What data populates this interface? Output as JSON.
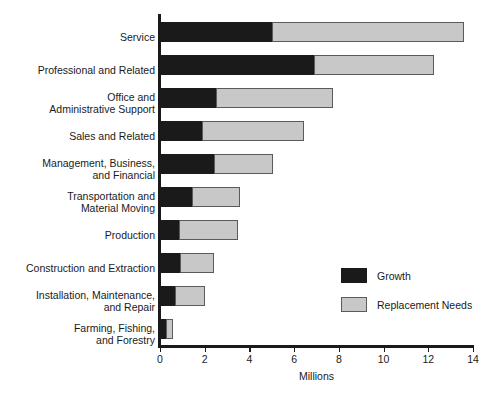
{
  "chart_data": {
    "type": "bar",
    "orientation": "horizontal",
    "stacked": true,
    "title": "",
    "xlabel": "Millions",
    "ylabel": "",
    "xlim": [
      0,
      14
    ],
    "xticks": [
      0,
      2,
      4,
      6,
      8,
      10,
      12,
      14
    ],
    "xtick_labels": [
      "0",
      "2",
      "4",
      "6",
      "8",
      "10",
      "12",
      "14"
    ],
    "grid": false,
    "legend_position": "inside-right",
    "categories": [
      "Service",
      "Professional and Related",
      "Office and\nAdministrative Support",
      "Sales and Related",
      "Management, Business,\nand Financial",
      "Transportation and\nMaterial Moving",
      "Production",
      "Construction and Extraction",
      "Installation, Maintenance,\nand Repair",
      "Farming, Fishing,\nand Forestry"
    ],
    "series": [
      {
        "name": "Growth",
        "color": "#1a1a1a",
        "values": [
          5.0,
          6.9,
          2.5,
          1.9,
          2.4,
          1.45,
          0.85,
          0.9,
          0.65,
          0.25
        ]
      },
      {
        "name": "Replacement Needs",
        "color": "#c8c8c8",
        "values": [
          8.6,
          5.35,
          5.25,
          4.55,
          2.65,
          2.15,
          2.65,
          1.5,
          1.35,
          0.35
        ]
      }
    ],
    "totals": [
      13.6,
      12.25,
      7.75,
      6.45,
      5.05,
      3.6,
      3.5,
      2.4,
      2.0,
      0.6
    ]
  },
  "legend": {
    "items": [
      {
        "label": "Growth",
        "swatch": "growth"
      },
      {
        "label": "Replacement Needs",
        "swatch": "replacement"
      }
    ]
  }
}
